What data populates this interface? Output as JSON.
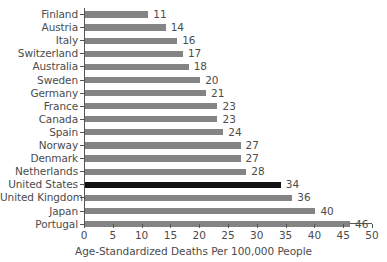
{
  "chart_data": {
    "type": "bar",
    "orientation": "horizontal",
    "title": "",
    "xlabel": "Age-Standardized Deaths Per 100,000 People",
    "ylabel": "",
    "xlim": [
      0,
      50
    ],
    "xticks": [
      0,
      5,
      10,
      15,
      20,
      25,
      30,
      35,
      40,
      45,
      50
    ],
    "grid": false,
    "legend": null,
    "categories": [
      "Finland",
      "Austria",
      "Italy",
      "Switzerland",
      "Australia",
      "Sweden",
      "Germany",
      "France",
      "Canada",
      "Spain",
      "Norway",
      "Denmark",
      "Netherlands",
      "United States",
      "United Kingdom",
      "Japan",
      "Portugal"
    ],
    "values": [
      11,
      14,
      16,
      17,
      18,
      20,
      21,
      23,
      23,
      24,
      27,
      27,
      28,
      34,
      36,
      40,
      46
    ],
    "data_labels": [
      "11",
      "14",
      "16",
      "17",
      "18",
      "20",
      "21",
      "23",
      "23",
      "24",
      "27",
      "27",
      "28",
      "34",
      "36",
      "40",
      "46"
    ],
    "highlighted_category": "United States",
    "colors": {
      "bar": "#848484",
      "bar_highlight": "#111111",
      "axis": "#555555",
      "text": "#4c4c4c",
      "background": "#ffffff"
    }
  }
}
